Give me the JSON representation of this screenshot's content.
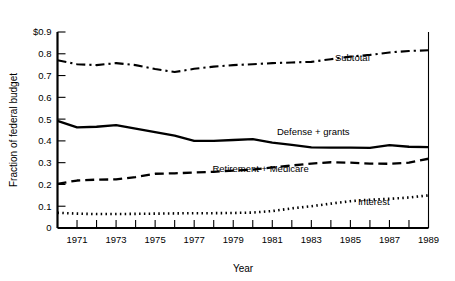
{
  "chart_data": {
    "type": "line",
    "title": "",
    "xlabel": "Year",
    "ylabel": "Fraction of federal budget",
    "xlim": [
      1970,
      1989
    ],
    "ylim": [
      0,
      0.9
    ],
    "grid": false,
    "legend_position": "inline-right",
    "y_ticks": [
      "0",
      "0.1",
      "0.2",
      "0.3",
      "0.4",
      "0.5",
      "0.6",
      "0.7",
      "0.8",
      "$0.9"
    ],
    "y_tick_values": [
      0,
      0.1,
      0.2,
      0.3,
      0.4,
      0.5,
      0.6,
      0.7,
      0.8,
      0.9
    ],
    "x_ticks": [
      "1971",
      "1973",
      "1975",
      "1977",
      "1979",
      "1981",
      "1983",
      "1985",
      "1987",
      "1989"
    ],
    "x_tick_values": [
      1971,
      1973,
      1975,
      1977,
      1979,
      1981,
      1983,
      1985,
      1987,
      1989
    ],
    "x_minor_tick_values": [
      1970,
      1971,
      1972,
      1973,
      1974,
      1975,
      1976,
      1977,
      1978,
      1979,
      1980,
      1981,
      1982,
      1983,
      1984,
      1985,
      1986,
      1987,
      1988,
      1989
    ],
    "x": [
      1970,
      1971,
      1972,
      1973,
      1974,
      1975,
      1976,
      1977,
      1978,
      1979,
      1980,
      1981,
      1982,
      1983,
      1984,
      1985,
      1986,
      1987,
      1988,
      1989
    ],
    "series": [
      {
        "name": "Subtotal",
        "style": "dash-dot",
        "label_x": 1985.1,
        "label_y": 0.765,
        "values": [
          0.77,
          0.752,
          0.748,
          0.757,
          0.748,
          0.73,
          0.716,
          0.731,
          0.741,
          0.748,
          0.752,
          0.757,
          0.76,
          0.763,
          0.775,
          0.787,
          0.795,
          0.806,
          0.813,
          0.816
        ]
      },
      {
        "name": "Defense + grants",
        "style": "solid",
        "label_x": 1983.1,
        "label_y": 0.425,
        "values": [
          0.492,
          0.462,
          0.465,
          0.472,
          0.456,
          0.44,
          0.424,
          0.4,
          0.4,
          0.404,
          0.408,
          0.392,
          0.382,
          0.37,
          0.369,
          0.369,
          0.368,
          0.381,
          0.373,
          0.371
        ]
      },
      {
        "name": "Retirement + Medicare",
        "style": "dashed",
        "label_x": 1980.4,
        "label_y": 0.255,
        "values": [
          0.203,
          0.218,
          0.222,
          0.223,
          0.234,
          0.249,
          0.251,
          0.255,
          0.258,
          0.263,
          0.268,
          0.278,
          0.287,
          0.296,
          0.302,
          0.3,
          0.296,
          0.295,
          0.3,
          0.318
        ]
      },
      {
        "name": "Interest",
        "style": "dotted",
        "label_x": 1986.2,
        "label_y": 0.105,
        "values": [
          0.07,
          0.066,
          0.064,
          0.064,
          0.065,
          0.066,
          0.067,
          0.068,
          0.068,
          0.069,
          0.071,
          0.078,
          0.09,
          0.1,
          0.112,
          0.123,
          0.13,
          0.134,
          0.14,
          0.15
        ]
      }
    ]
  }
}
